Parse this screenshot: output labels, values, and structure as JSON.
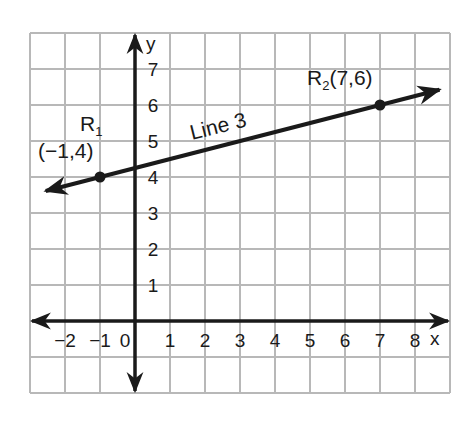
{
  "chart_data": {
    "type": "line",
    "title": "",
    "xlabel": "x",
    "ylabel": "y",
    "xlim": [
      -3,
      9
    ],
    "ylim": [
      -2,
      8
    ],
    "grid": true,
    "x_ticks": [
      "-2",
      "-1",
      "0",
      "1",
      "2",
      "3",
      "4",
      "5",
      "6",
      "7",
      "8"
    ],
    "y_ticks": [
      "1",
      "2",
      "3",
      "4",
      "5",
      "6",
      "7"
    ],
    "series": [
      {
        "name": "Line 3",
        "type": "line",
        "slope": 0.25,
        "intercept": 4.25,
        "points": [
          {
            "label": "R1",
            "x": -1,
            "y": 4,
            "text": "(−1,4)"
          },
          {
            "label": "R2",
            "x": 7,
            "y": 6,
            "text": "(7,6)"
          }
        ]
      }
    ],
    "annotations": {
      "line_label": "Line 3",
      "r1_name": "R",
      "r1_sub": "1",
      "r1_coords": "(−1,4)",
      "r2_name": "R",
      "r2_sub": "2",
      "r2_coords": "(7,6)"
    }
  },
  "colors": {
    "grid": "#b8b8b8",
    "axis": "#1a1a1a",
    "line": "#1a1a1a",
    "background": "#ffffff"
  }
}
